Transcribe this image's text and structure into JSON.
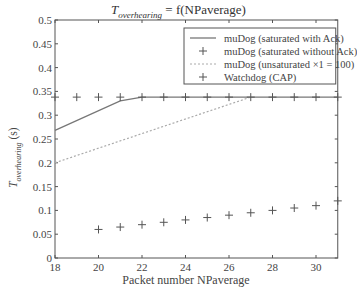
{
  "chart_data": {
    "type": "line",
    "title_parts": {
      "var": "T",
      "sub": "overhearing",
      "rest": " = f(NPaverage)"
    },
    "xlabel": "Packet number NPaverage",
    "ylabel": "T_overhearing (s)",
    "ylabel_parts": {
      "var": "T",
      "sub": "overhearing",
      "rest": " (s)"
    },
    "xlim": [
      18,
      31
    ],
    "ylim": [
      0,
      0.5
    ],
    "x_ticks": [
      18,
      20,
      22,
      24,
      26,
      28,
      30
    ],
    "y_ticks": [
      0,
      0.05,
      0.1,
      0.15,
      0.2,
      0.25,
      0.3,
      0.35,
      0.4,
      0.45,
      0.5
    ],
    "grid": false,
    "legend_position": "upper right",
    "series": [
      {
        "name": "muDog (saturated with Ack)",
        "style": "solid",
        "marker": "none",
        "x": [
          18,
          21,
          22,
          31
        ],
        "y": [
          0.268,
          0.33,
          0.338,
          0.338
        ]
      },
      {
        "name": "muDog (saturated without Ack)",
        "style": "none",
        "marker": "+",
        "x": [
          20,
          21,
          22,
          23,
          24,
          25,
          26,
          27,
          28,
          29,
          30,
          31
        ],
        "y": [
          0.06,
          0.065,
          0.07,
          0.075,
          0.08,
          0.085,
          0.09,
          0.095,
          0.1,
          0.105,
          0.11,
          0.12
        ]
      },
      {
        "name": "muDog (unsaturated ×1 = 100)",
        "style": "dotted",
        "marker": "none",
        "x": [
          18,
          27
        ],
        "y": [
          0.2,
          0.338
        ]
      },
      {
        "name": "Watchdog (CAP)",
        "style": "none",
        "marker": "+",
        "x": [
          18,
          19,
          20,
          21,
          22,
          23,
          24,
          25,
          26,
          27,
          28,
          29,
          30,
          31
        ],
        "y": [
          0.338,
          0.338,
          0.338,
          0.338,
          0.338,
          0.338,
          0.338,
          0.338,
          0.338,
          0.338,
          0.338,
          0.338,
          0.338,
          0.338
        ]
      }
    ]
  }
}
